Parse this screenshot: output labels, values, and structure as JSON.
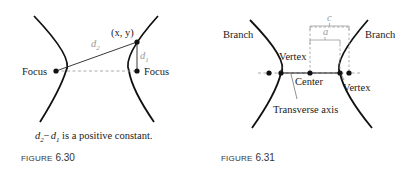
{
  "figure_630": {
    "focus_left_label": "Focus",
    "focus_right_label": "Focus",
    "point_label": "(x, y)",
    "d2_label": "d",
    "d2_sub": "2",
    "d1_label": "d",
    "d1_sub": "1",
    "caption_d2": "d",
    "caption_d2_sub": "2",
    "caption_minus": "−",
    "caption_d1": "d",
    "caption_d1_sub": "1",
    "caption_rest": " is a positive constant.",
    "figure_word": "FIGURE",
    "figure_number": "6.30"
  },
  "figure_631": {
    "branch_left_label": "Branch",
    "branch_right_label": "Branch",
    "vertex_left_label": "Vertex",
    "vertex_right_label": "Vertex",
    "center_label": "Center",
    "transverse_axis_label": "Transverse axis",
    "c_label": "c",
    "a_label": "a",
    "figure_word": "FIGURE",
    "figure_number": "6.31"
  },
  "colors": {
    "curve": "#111111",
    "gray_label": "#9a9a9a",
    "dashed": "#a0a0a0"
  }
}
